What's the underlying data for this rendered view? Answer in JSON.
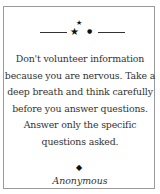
{
  "quote_card": {
    "ornament": {
      "icon": "stars-ornament-icon"
    },
    "quote_lines": [
      "Don't volunteer information",
      "because you are nervous. Take a",
      "deep breath and think carefully",
      "before you answer questions.",
      "Answer only the specific",
      "questions asked."
    ],
    "separator_icon": "diamond-icon",
    "separator_glyph": "◆",
    "author": "Anonymous",
    "colors": {
      "border": "#9a9a9a",
      "text": "#333333",
      "ornament": "#111111"
    }
  }
}
